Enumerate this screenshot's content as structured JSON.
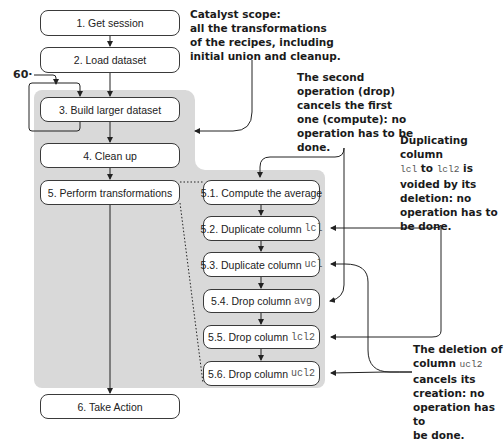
{
  "main_flow": [
    {
      "id": "1",
      "label": "1. Get session"
    },
    {
      "id": "2",
      "label": "2. Load dataset"
    },
    {
      "id": "3",
      "label": "3. Build larger dataset"
    },
    {
      "id": "4",
      "label": "4. Clean up"
    },
    {
      "id": "5",
      "label": "5. Perform transformations"
    },
    {
      "id": "6",
      "label": "6. Take Action"
    }
  ],
  "sub_flow": [
    {
      "id": "5.1",
      "text": "5.1. Compute the average",
      "code": ""
    },
    {
      "id": "5.2",
      "text": "5.2. Duplicate column ",
      "code": "lcl"
    },
    {
      "id": "5.3",
      "text": "5.3. Duplicate column ",
      "code": "ucl"
    },
    {
      "id": "5.4",
      "text": "5.4. Drop column ",
      "code": "avg"
    },
    {
      "id": "5.5",
      "text": "5.5. Drop column ",
      "code": "lcl2"
    },
    {
      "id": "5.6",
      "text": "5.6. Drop column ",
      "code": "ucl2"
    }
  ],
  "loop_label": "60",
  "annotations": {
    "catalyst": {
      "l1": "Catalyst scope:",
      "l2": "all the transformations",
      "l3": "of the recipes, including",
      "l4": "initial union and cleanup."
    },
    "drop_compute": {
      "l1": "The second",
      "l2": "operation (drop)",
      "l3": "cancels the first",
      "l4": "one (compute): no",
      "l5": "operation has to be",
      "l6": "done."
    },
    "duplicate": {
      "l1": "Duplicating column",
      "code1": "lcl",
      "to": " to ",
      "code2": "lcl2",
      "is": " is",
      "l3": "voided by its",
      "l4": "deletion: no",
      "l5": "operation has to",
      "l6": "be done."
    },
    "deletion": {
      "l1": "The deletion of",
      "l2a": "column ",
      "code": "ucl2",
      "l3": "cancels its",
      "l4": "creation: no",
      "l5": "operation has to",
      "l6": "be done."
    }
  },
  "colors": {
    "scope_fill": "#d9d9d9",
    "box_border": "#3a3a3a"
  }
}
